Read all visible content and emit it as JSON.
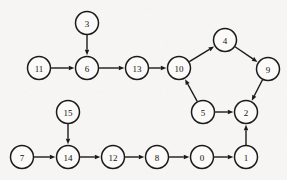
{
  "diagram": {
    "background_color": "#f6f5f3",
    "node_fill_color": "#fbfaf8",
    "node_stroke_color": "#1a1a1a",
    "edge_color": "#1a1a1a",
    "label_color": "#111111",
    "node_radius": 11.5,
    "arrow_head_length": 5.5,
    "arrow_head_width": 4.4,
    "node_count": 16,
    "edge_count": 16
  },
  "nodes": [
    {
      "id": "3",
      "label": "3",
      "x": 87,
      "y": 23
    },
    {
      "id": "11",
      "label": "11",
      "x": 39,
      "y": 68
    },
    {
      "id": "6",
      "label": "6",
      "x": 87,
      "y": 68
    },
    {
      "id": "13",
      "label": "13",
      "x": 137,
      "y": 68
    },
    {
      "id": "10",
      "label": "10",
      "x": 179,
      "y": 68
    },
    {
      "id": "4",
      "label": "4",
      "x": 225,
      "y": 40
    },
    {
      "id": "9",
      "label": "9",
      "x": 268,
      "y": 69
    },
    {
      "id": "5",
      "label": "5",
      "x": 203,
      "y": 112
    },
    {
      "id": "2",
      "label": "2",
      "x": 246,
      "y": 112
    },
    {
      "id": "15",
      "label": "15",
      "x": 68,
      "y": 112
    },
    {
      "id": "7",
      "label": "7",
      "x": 22,
      "y": 157
    },
    {
      "id": "14",
      "label": "14",
      "x": 68,
      "y": 157
    },
    {
      "id": "12",
      "label": "12",
      "x": 113,
      "y": 157
    },
    {
      "id": "8",
      "label": "8",
      "x": 157,
      "y": 157
    },
    {
      "id": "0",
      "label": "0",
      "x": 202,
      "y": 157
    },
    {
      "id": "1",
      "label": "1",
      "x": 246,
      "y": 157
    }
  ],
  "edges": [
    {
      "from": "3",
      "to": "6"
    },
    {
      "from": "11",
      "to": "6"
    },
    {
      "from": "6",
      "to": "13"
    },
    {
      "from": "13",
      "to": "10"
    },
    {
      "from": "10",
      "to": "4"
    },
    {
      "from": "4",
      "to": "9"
    },
    {
      "from": "9",
      "to": "2"
    },
    {
      "from": "5",
      "to": "10"
    },
    {
      "from": "5",
      "to": "2"
    },
    {
      "from": "1",
      "to": "2"
    },
    {
      "from": "15",
      "to": "14"
    },
    {
      "from": "7",
      "to": "14"
    },
    {
      "from": "14",
      "to": "12"
    },
    {
      "from": "12",
      "to": "8"
    },
    {
      "from": "8",
      "to": "0"
    },
    {
      "from": "0",
      "to": "1"
    }
  ]
}
